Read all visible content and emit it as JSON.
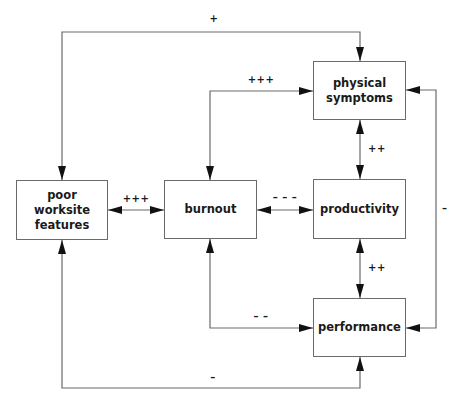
{
  "diagram": {
    "boxes": {
      "poor_worksite_features": "poor\nworksite\nfeatures",
      "burnout": "burnout",
      "physical_symptoms": "physical\nsymptoms",
      "productivity": "productivity",
      "performance": "performance"
    },
    "edges": [
      {
        "from": "poor_worksite_features",
        "to": "physical_symptoms",
        "label": "+"
      },
      {
        "from": "burnout",
        "to": "physical_symptoms",
        "label": "+++"
      },
      {
        "from": "poor_worksite_features",
        "to": "burnout",
        "label": "+++"
      },
      {
        "from": "burnout",
        "to": "productivity",
        "label": "– – –"
      },
      {
        "from": "physical_symptoms",
        "to": "productivity",
        "label": "++"
      },
      {
        "from": "productivity",
        "to": "performance",
        "label": "++"
      },
      {
        "from": "physical_symptoms",
        "to": "performance",
        "label": "–"
      },
      {
        "from": "burnout",
        "to": "performance",
        "label": "– –"
      },
      {
        "from": "poor_worksite_features",
        "to": "performance",
        "label": "–"
      }
    ],
    "colors": {
      "line": "#6a6a6a",
      "arrow": "#111111",
      "text": "#1a1a1a"
    }
  }
}
